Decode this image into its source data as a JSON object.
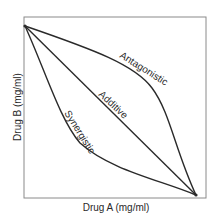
{
  "diagram": {
    "type": "isobologram",
    "x_axis_label": "Drug A (mg/ml)",
    "y_axis_label": "Drug B (mg/ml)",
    "curves": [
      {
        "name": "Antagonistic",
        "label": "Antagonistic",
        "shape": "convex"
      },
      {
        "name": "Additive",
        "label": "Additive",
        "shape": "linear"
      },
      {
        "name": "Synergistic",
        "label": "Synergistic",
        "shape": "concave"
      }
    ]
  },
  "colors": {
    "line": "#2a2a2a",
    "frame": "#8a8a8a",
    "background": "#ffffff"
  }
}
